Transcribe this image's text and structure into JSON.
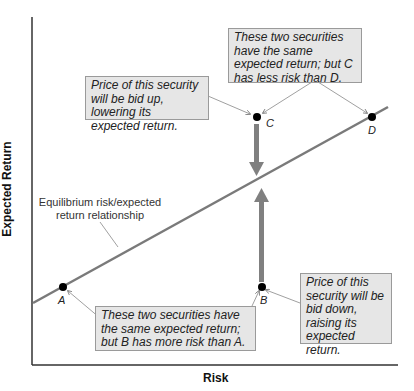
{
  "axes": {
    "x_label": "Risk",
    "y_label": "Expected Return"
  },
  "line_label": {
    "line1": "Equilibrium risk/expected",
    "line2": "return relationship"
  },
  "points": [
    {
      "id": "A",
      "label": "A"
    },
    {
      "id": "B",
      "label": "B"
    },
    {
      "id": "C",
      "label": "C"
    },
    {
      "id": "D",
      "label": "D"
    }
  ],
  "callouts": {
    "bid_up": "Price of this security will be bid up, lowering its expected return.",
    "c_vs_d": "These two securities have the same expected return; but C has less risk than D.",
    "a_vs_b": "These two securities have the same expected return; but B has more risk than A.",
    "bid_down": "Price of this security will be bid down, raising its expected return."
  },
  "colors": {
    "line": "#7a7a7a",
    "arrow": "#808080",
    "box_fill": "#e6e6e6",
    "point": "#000000"
  }
}
